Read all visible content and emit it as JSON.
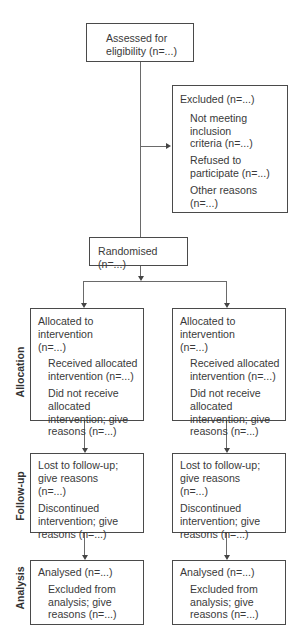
{
  "enrollment": {
    "assessed": "Assessed for eligibility (n=...)",
    "excluded": {
      "label": "Excluded  (n=...)",
      "reasons": [
        "Not meeting inclusion criteria (n=...)",
        "Refused to participate (n=...)",
        "Other reasons (n=...)"
      ]
    },
    "randomised": "Randomised (n=...)"
  },
  "stages": {
    "allocation": "Allocation",
    "follow_up": "Follow-up",
    "analysis": "Analysis"
  },
  "arms": [
    {
      "allocation": {
        "label": "Allocated to intervention (n=...)",
        "items": [
          "Received allocated intervention (n=...)",
          "Did not receive allocated intervention; give reasons (n=...)"
        ]
      },
      "follow_up": [
        "Lost to follow-up; give reasons (n=...)",
        "Discontinued intervention; give reasons (n=...)"
      ],
      "analysis": {
        "label": "Analysed (n=...)",
        "items": [
          "Excluded from analysis; give reasons (n=...)"
        ]
      }
    },
    {
      "allocation": {
        "label": "Allocated to intervention (n=...)",
        "items": [
          "Received allocated intervention (n=...)",
          "Did not receive allocated intervention; give reasons (n=...)"
        ]
      },
      "follow_up": [
        "Lost to follow-up; give reasons (n=...)",
        "Discontinued intervention; give reasons (n=...)"
      ],
      "analysis": {
        "label": "Analysed (n=...)",
        "items": [
          "Excluded from analysis; give reasons (n=...)"
        ]
      }
    }
  ]
}
